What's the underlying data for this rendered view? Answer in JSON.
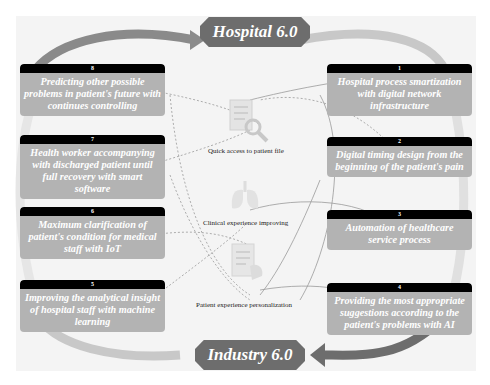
{
  "top_hub": {
    "label": "Hospital 6.0"
  },
  "bottom_hub": {
    "label": "Industry 6.0"
  },
  "left_cards": [
    {
      "number": "8",
      "text": "Predicting other possible problems in patient's future with continues controlling"
    },
    {
      "number": "7",
      "text": "Health worker accompanying with discharged patient until full recovery with smart software"
    },
    {
      "number": "6",
      "text": "Maximum clarification of patient's condition for medical staff with IoT"
    },
    {
      "number": "5",
      "text": "Improving the analytical insight of hospital staff with machine learning"
    }
  ],
  "right_cards": [
    {
      "number": "1",
      "text": "Hospital process smartization with digital network infrastructure"
    },
    {
      "number": "2",
      "text": "Digital timing design from the beginning of the patient's pain"
    },
    {
      "number": "3",
      "text": "Automation of healthcare service process"
    },
    {
      "number": "4",
      "text": "Providing the most appropriate suggestions according to the patient's problems with AI"
    }
  ],
  "center": {
    "items": [
      {
        "icon": "patient-file-search-icon",
        "label": "Quick access to patient file"
      },
      {
        "icon": "lungs-icon",
        "label": "Clinical experience improving"
      },
      {
        "icon": "clipboard-hand-icon",
        "label": "Patient experience personalization"
      }
    ]
  },
  "colors": {
    "card_bg": "#b3b3b3",
    "card_header": "#000000",
    "hub_bg": "#6d6d6d",
    "arrow_light": "#c8c8c8",
    "arrow_dark": "#6d6d6d",
    "frame_bg": "#f4f4f4"
  }
}
